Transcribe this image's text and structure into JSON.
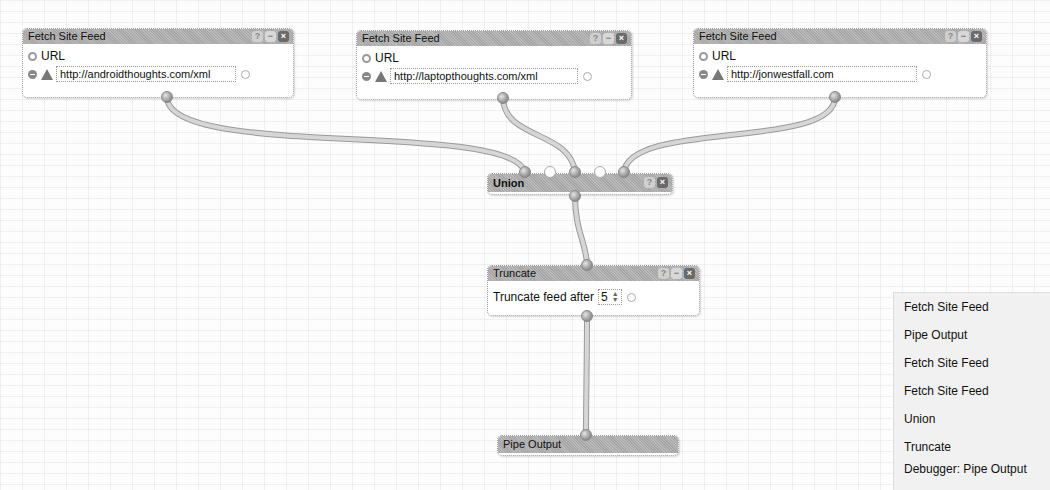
{
  "modules": {
    "feed1": {
      "title": "Fetch Site Feed",
      "field_label": "URL",
      "url": "http://androidthoughts.com/xml"
    },
    "feed2": {
      "title": "Fetch Site Feed",
      "field_label": "URL",
      "url": "http://laptopthoughts.com/xml"
    },
    "feed3": {
      "title": "Fetch Site Feed",
      "field_label": "URL",
      "url": "http://jonwestfall.com"
    },
    "union": {
      "title": "Union"
    },
    "truncate": {
      "title": "Truncate",
      "label": "Truncate feed after",
      "value": "5"
    },
    "output": {
      "title": "Pipe Output"
    }
  },
  "controls": {
    "help": "?",
    "minimize": "−",
    "close": "×"
  },
  "menu": {
    "items": [
      "Fetch Site Feed",
      "Pipe Output",
      "Fetch Site Feed",
      "Fetch Site Feed",
      "Union",
      "Truncate",
      "Debugger: Pipe Output"
    ]
  },
  "colors": {
    "wire": "#c9c9c9",
    "wire_edge": "#9a9a9a",
    "header": "#b0b0b0"
  }
}
